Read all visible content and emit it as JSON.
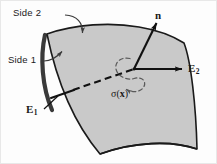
{
  "figure": {
    "background_color": "#fdfdfd",
    "surface_fill": "#c9c9c9",
    "surface_stroke": "#1a1a1a",
    "edge_shadow_color": "#3a3a3a",
    "line_color": "#111111"
  },
  "labels": {
    "side2": "Side 2",
    "side1": "Side 1",
    "normal": "n",
    "e1_letter": "E",
    "e1_sub": "1",
    "e2_letter": "E",
    "e2_sub": "2",
    "sigma_open": "σ(",
    "sigma_arg": "x",
    "sigma_close": ")"
  },
  "annotations": {
    "side2_arrow_target": "top-surface",
    "side1_arrow_target": "left-thick-edge",
    "normal_vector_direction": "up-right",
    "e1_vector_direction": "up-right-into-surface",
    "e2_vector_direction": "right-horizontal",
    "sigma_loop": "dashed-circulation-loop"
  }
}
